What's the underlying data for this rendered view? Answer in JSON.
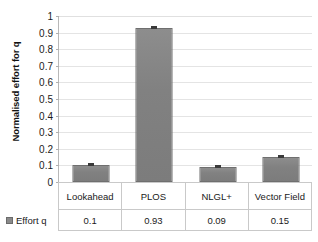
{
  "chart_data": {
    "type": "bar",
    "title": "",
    "xlabel": "",
    "ylabel": "Normalised effort for q",
    "categories": [
      "Lookahead",
      "PLOS",
      "NLGL+",
      "Vector Field"
    ],
    "values": [
      0.1,
      0.93,
      0.09,
      0.15
    ],
    "value_labels": [
      "0.1",
      "0.93",
      "0.09",
      "0.15"
    ],
    "series": [
      {
        "name": "Effort q",
        "values": [
          0.1,
          0.93,
          0.09,
          0.15
        ]
      }
    ],
    "ylim": [
      0,
      1
    ],
    "ytick_step": 0.1,
    "ytick_labels": [
      "1",
      "0.9",
      "0.8",
      "0.7",
      "0.6",
      "0.5",
      "0.4",
      "0.3",
      "0.2",
      "0.1",
      "0"
    ],
    "ytick_values": [
      1,
      0.9,
      0.8,
      0.7,
      0.6,
      0.5,
      0.4,
      0.3,
      0.2,
      0.1,
      0
    ],
    "grid": true,
    "legend_position": "data-table-left",
    "error_bars": true,
    "bar_color": "#818181",
    "bar_border_color": "#6f6f6f",
    "gridline_color": "#e4e4e4",
    "axis_color": "#b8b8b8",
    "error_bar_color": "#3a3a3a"
  },
  "legend": {
    "series_label": "Effort q",
    "swatch_icon": "legend-square-icon",
    "swatch_color": "#8a8a8a"
  },
  "table": {
    "category_row": [
      "Lookahead",
      "PLOS",
      "NLGL+",
      "Vector Field"
    ],
    "value_row": [
      "0.1",
      "0.93",
      "0.09",
      "0.15"
    ]
  }
}
